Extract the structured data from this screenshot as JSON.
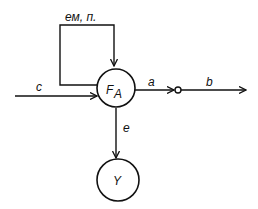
{
  "diagram": {
    "nodes": [
      {
        "id": "FA",
        "label_main": "F",
        "label_sub": "A"
      },
      {
        "id": "Y",
        "label": "Y"
      }
    ],
    "edges": [
      {
        "id": "c",
        "label": "c",
        "from": "input",
        "to": "FA"
      },
      {
        "id": "loop",
        "label": "ем, п.",
        "from": "FA",
        "to": "FA"
      },
      {
        "id": "a",
        "label": "a",
        "from": "FA",
        "to": "junction"
      },
      {
        "id": "b",
        "label": "b",
        "from": "junction",
        "to": "output"
      },
      {
        "id": "e",
        "label": "e",
        "from": "FA",
        "to": "Y"
      }
    ]
  }
}
